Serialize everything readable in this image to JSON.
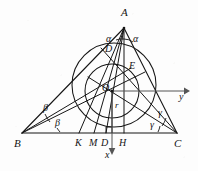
{
  "figure": {
    "stroke_color": "#161616",
    "axis_color": "#4a4a4a",
    "background_color": "#fdfdfd"
  },
  "vertices": [
    {
      "name": "A",
      "label": "A",
      "x": 124,
      "y": 28
    },
    {
      "name": "B",
      "label": "B",
      "x": 22,
      "y": 133
    },
    {
      "name": "C",
      "label": "C",
      "x": 177,
      "y": 133
    }
  ],
  "points": [
    {
      "name": "D-upper",
      "label": "D",
      "x": 110,
      "y": 51
    },
    {
      "name": "E",
      "label": "E",
      "x": 131,
      "y": 68
    },
    {
      "name": "O",
      "label": "O",
      "x": 109,
      "y": 89
    },
    {
      "name": "K",
      "label": "K",
      "x": 79,
      "y": 133
    },
    {
      "name": "M",
      "label": "M",
      "x": 94,
      "y": 133
    },
    {
      "name": "D-base",
      "label": "D",
      "x": 106,
      "y": 133
    },
    {
      "name": "H",
      "label": "H",
      "x": 124,
      "y": 133
    }
  ],
  "angle_labels": [
    {
      "name": "alpha-left",
      "label": "α",
      "x": 110,
      "y": 40
    },
    {
      "name": "alpha-right",
      "label": "α",
      "x": 136,
      "y": 40
    },
    {
      "name": "beta-upper",
      "label": "β",
      "x": 46,
      "y": 108
    },
    {
      "name": "beta-lower",
      "label": "β",
      "x": 57,
      "y": 123
    },
    {
      "name": "gamma-upper",
      "label": "γ",
      "x": 160,
      "y": 113
    },
    {
      "name": "gamma-lower",
      "label": "γ",
      "x": 152,
      "y": 125
    }
  ],
  "measure_labels": [
    {
      "name": "inradius",
      "label": "r",
      "x": 117,
      "y": 106
    }
  ],
  "axes": [
    {
      "name": "x-axis",
      "label": "x",
      "direction": "down",
      "label_x": 108,
      "label_y": 155
    },
    {
      "name": "y-axis",
      "label": "y",
      "direction": "right",
      "label_x": 181,
      "label_y": 92
    }
  ],
  "circles": [
    {
      "name": "incircle",
      "cx": 112,
      "cy": 91,
      "r": 27
    },
    {
      "name": "outer-circle",
      "cx": 114,
      "cy": 85,
      "r": 42
    }
  ]
}
